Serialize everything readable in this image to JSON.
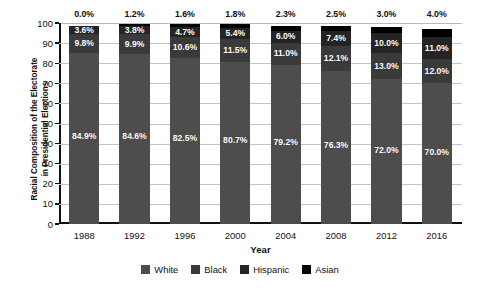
{
  "top_cut_text": "",
  "chart_data": {
    "type": "bar",
    "subtype": "stacked-100-percent",
    "title": "",
    "xlabel": "Year",
    "ylabel": "Racial Composition of the Electorate in Presidential Elections",
    "ylabel_line1": "Racial Composition of the Electorate",
    "ylabel_line2": "in Presidential Elections",
    "ylim": [
      0,
      100
    ],
    "ytick_step": 10,
    "yticks": [
      0,
      10,
      20,
      30,
      40,
      50,
      60,
      70,
      80,
      90,
      100
    ],
    "ytick_labels": [
      "0",
      "10",
      "20",
      "30",
      "40",
      "50",
      "60",
      "70",
      "80",
      "90",
      "100"
    ],
    "grid": true,
    "legend_position": "bottom",
    "categories": [
      "1988",
      "1992",
      "1996",
      "2000",
      "2004",
      "2008",
      "2012",
      "2016"
    ],
    "series": [
      {
        "name": "White",
        "color": "#4d4d4d",
        "values": [
          84.9,
          84.6,
          82.5,
          80.7,
          79.2,
          76.3,
          72.0,
          70.0
        ],
        "labels": [
          "84.9%",
          "84.6%",
          "82.5%",
          "80.7%",
          "79.2%",
          "76.3%",
          "72.0%",
          "70.0%"
        ],
        "label_placement": "inside"
      },
      {
        "name": "Black",
        "color": "#3a3a3a",
        "values": [
          9.8,
          9.9,
          10.6,
          11.5,
          11.0,
          12.1,
          13.0,
          12.0
        ],
        "labels": [
          "9.8%",
          "9.9%",
          "10.6%",
          "11.5%",
          "11.0%",
          "12.1%",
          "13.0%",
          "12.0%"
        ],
        "label_placement": "inside"
      },
      {
        "name": "Hispanic",
        "color": "#242424",
        "values": [
          3.6,
          3.8,
          4.7,
          5.4,
          6.0,
          7.4,
          10.0,
          11.0
        ],
        "labels": [
          "3.6%",
          "3.8%",
          "4.7%",
          "5.4%",
          "6.0%",
          "7.4%",
          "10.0%",
          "11.0%"
        ],
        "label_placement": "inside"
      },
      {
        "name": "Asian",
        "color": "#000000",
        "values": [
          0.0,
          1.2,
          1.6,
          1.8,
          2.3,
          2.5,
          3.0,
          4.0
        ],
        "labels": [
          "0.0%",
          "1.2%",
          "1.6%",
          "1.8%",
          "2.3%",
          "2.5%",
          "3.0%",
          "4.0%"
        ],
        "label_placement": "above-bar"
      }
    ],
    "legend": [
      {
        "label": "White",
        "color": "#4d4d4d"
      },
      {
        "label": "Black",
        "color": "#3a3a3a"
      },
      {
        "label": "Hispanic",
        "color": "#242424"
      },
      {
        "label": "Asian",
        "color": "#000000"
      }
    ]
  }
}
